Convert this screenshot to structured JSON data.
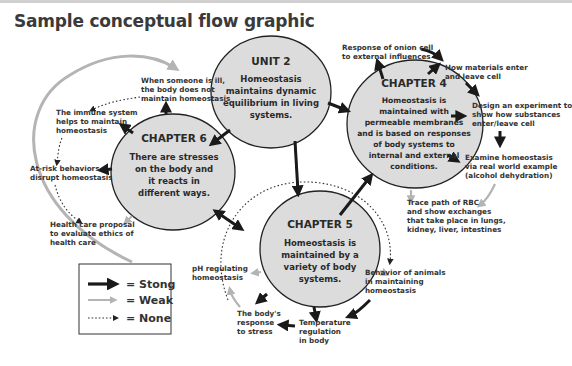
{
  "title": "Sample conceptual flow graphic",
  "nodes": {
    "unit2": {
      "heading": "UNIT 2",
      "lines": [
        "Homeostasis",
        "maintains dynamic",
        "equilibrium in living",
        "systems."
      ]
    },
    "ch4": {
      "heading": "CHAPTER 4",
      "lines": [
        "Homeostasis is",
        "maintained with",
        "permeable membranes",
        "and is based on responses",
        "of body systems to",
        "internal and external",
        "conditions."
      ]
    },
    "ch5": {
      "heading": "CHAPTER 5",
      "lines": [
        "Homeostasis is",
        "maintained by a",
        "variety of body",
        "systems."
      ]
    },
    "ch6": {
      "heading": "CHAPTER 6",
      "lines": [
        "There are stresses",
        "on the body and",
        "it reacts in",
        "different ways."
      ]
    }
  },
  "labels": {
    "ill": [
      "When someone is ill,",
      "the body does not",
      "maintain homeostasis"
    ],
    "immune": [
      "The immune system",
      "helps to maintain",
      "homeostasis"
    ],
    "atrisk": [
      "At-risk behaviors",
      "disrupt homeostasis"
    ],
    "healthcare": [
      "Health care proposal",
      "to evaluate ethics of",
      "health care"
    ],
    "onion": [
      "Response of onion cell",
      "to external influences"
    ],
    "materials": [
      "How materials enter",
      "and leave cell"
    ],
    "design": [
      "Design an experiment to",
      "show how substances",
      "enter/leave cell"
    ],
    "examine": [
      "Examine homeostasis",
      "via real world example",
      "(alcohol dehydration)"
    ],
    "rbc": [
      "Trace path of RBC",
      "and show exchanges",
      "that take place in lungs,",
      "kidney, liver, intestines"
    ],
    "ph": [
      "pH regulating",
      "homeostasis"
    ],
    "stress": [
      "The body's",
      "response",
      "to stress"
    ],
    "temp": [
      "Temperature",
      "regulation",
      "in body"
    ],
    "animals": [
      "Behavior of animals",
      "in maintaining",
      "homeostasis"
    ]
  },
  "legend": {
    "strong": "= Stong",
    "weak": "= Weak",
    "none": "= None"
  },
  "colors": {
    "circle_fill": "#dcdcdc",
    "strong": "#1a1a1a",
    "weak": "#b4b4b4",
    "none": "#222222"
  }
}
